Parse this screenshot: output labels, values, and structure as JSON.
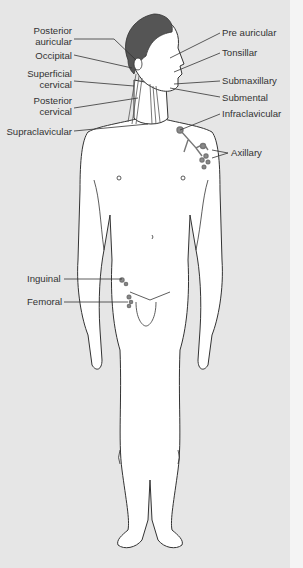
{
  "diagram": {
    "colors": {
      "background": "#e6e6e6",
      "body_fill": "#ffffff",
      "outline": "#333333",
      "hair": "#555555",
      "nodes": "#8a8a8a"
    },
    "labels_left": [
      {
        "id": "posterior-auricular",
        "line1": "Posterior",
        "line2": "auricular"
      },
      {
        "id": "occipital",
        "line1": "Occipital",
        "line2": ""
      },
      {
        "id": "superficial-cervical",
        "line1": "Superficial",
        "line2": "cervical"
      },
      {
        "id": "posterior-cervical",
        "line1": "Posterior",
        "line2": "cervical"
      },
      {
        "id": "supraclavicular",
        "line1": "Supraclavicular",
        "line2": ""
      },
      {
        "id": "inguinal",
        "line1": "Inguinal",
        "line2": ""
      },
      {
        "id": "femoral",
        "line1": "Femoral",
        "line2": ""
      }
    ],
    "labels_right": [
      {
        "id": "pre-auricular",
        "text": "Pre auricular"
      },
      {
        "id": "tonsillar",
        "text": "Tonsillar"
      },
      {
        "id": "submaxillary",
        "text": "Submaxillary"
      },
      {
        "id": "submental",
        "text": "Submental"
      },
      {
        "id": "infraclavicular",
        "text": "Infraclavicular"
      },
      {
        "id": "axillary",
        "text": "Axillary"
      }
    ]
  }
}
